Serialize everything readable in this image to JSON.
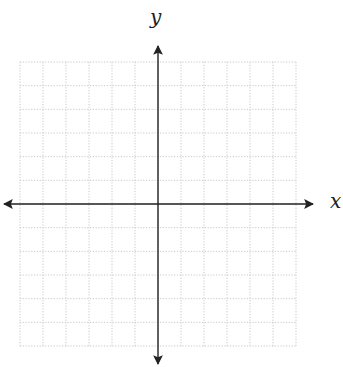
{
  "diagram": {
    "type": "coordinate-plane",
    "x_axis_label": "x",
    "y_axis_label": "y",
    "grid": {
      "columns": 12,
      "rows": 12,
      "line_style": "dotted",
      "line_color": "#c8c8c8"
    },
    "axis_color": "#222222",
    "axes_have_arrows": true,
    "tick_labels": []
  }
}
